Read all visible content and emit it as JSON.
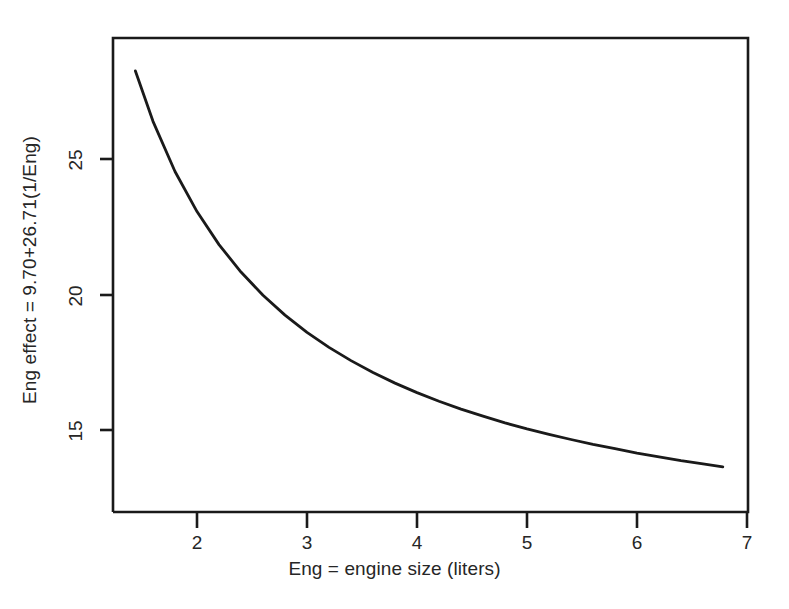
{
  "chart_data": {
    "type": "line",
    "title": "",
    "subtitle": "",
    "xlabel": "Eng = engine size (liters)",
    "ylabel": "Eng effect = 9.70+26.71(1/Eng)",
    "equation": "Eng effect = 9.70+26.71(1/Eng)",
    "intercept": 9.7,
    "coefficient": 26.71,
    "xlim": [
      1.28,
      7.0
    ],
    "ylim": [
      12.4,
      29.3
    ],
    "grid": false,
    "legend": null,
    "xticks": [
      2,
      3,
      4,
      5,
      6,
      7
    ],
    "xtick_labels": [
      "2",
      "3",
      "4",
      "5",
      "6",
      "7"
    ],
    "yticks": [
      15,
      20,
      25
    ],
    "ytick_labels": [
      "15",
      "20",
      "25"
    ],
    "series": [
      {
        "name": "Eng effect = 9.70+26.71(1/Eng)",
        "color": "#1a1a1a",
        "x": [
          1.44,
          1.6,
          1.8,
          2.0,
          2.2,
          2.4,
          2.6,
          2.8,
          3.0,
          3.2,
          3.4,
          3.6,
          3.8,
          4.0,
          4.2,
          4.4,
          4.6,
          4.8,
          5.0,
          5.2,
          5.4,
          5.6,
          5.8,
          6.0,
          6.2,
          6.4,
          6.6,
          6.78
        ],
        "y": [
          28.25,
          26.39,
          24.54,
          23.06,
          21.84,
          20.83,
          19.97,
          19.24,
          18.6,
          18.05,
          17.56,
          17.12,
          16.73,
          16.38,
          16.06,
          15.77,
          15.51,
          15.26,
          15.04,
          14.84,
          14.65,
          14.47,
          14.31,
          14.15,
          14.01,
          13.87,
          13.75,
          13.64
        ]
      }
    ]
  },
  "axes": {
    "x_title": "Eng = engine size (liters)",
    "y_title": "Eng effect = 9.70+26.71(1/Eng)"
  },
  "xtick_labels": [
    "2",
    "3",
    "4",
    "5",
    "6",
    "7"
  ],
  "ytick_labels": [
    "25",
    "20",
    "15"
  ]
}
